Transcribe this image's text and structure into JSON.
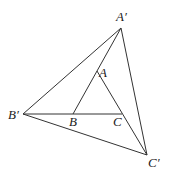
{
  "diagram": {
    "type": "geometry",
    "points": {
      "A_prime": {
        "label": "A′",
        "x": 121,
        "y": 28,
        "lx": 116,
        "ly": 21
      },
      "A": {
        "label": "A",
        "x": 97,
        "y": 71,
        "lx": 99,
        "ly": 77
      },
      "B_prime": {
        "label": "B′",
        "x": 23,
        "y": 114,
        "lx": 8,
        "ly": 119
      },
      "B": {
        "label": "B",
        "x": 73,
        "y": 114,
        "lx": 69,
        "ly": 126
      },
      "C": {
        "label": "C",
        "x": 122,
        "y": 114,
        "lx": 113,
        "ly": 126
      },
      "C_prime": {
        "label": "C′",
        "x": 147,
        "y": 155,
        "lx": 148,
        "ly": 167
      }
    },
    "segments": [
      [
        "A_prime",
        "B_prime"
      ],
      [
        "B_prime",
        "C_prime"
      ],
      [
        "A_prime",
        "C_prime"
      ],
      [
        "A_prime",
        "B"
      ],
      [
        "A",
        "C_prime"
      ],
      [
        "B_prime",
        "C"
      ]
    ]
  }
}
